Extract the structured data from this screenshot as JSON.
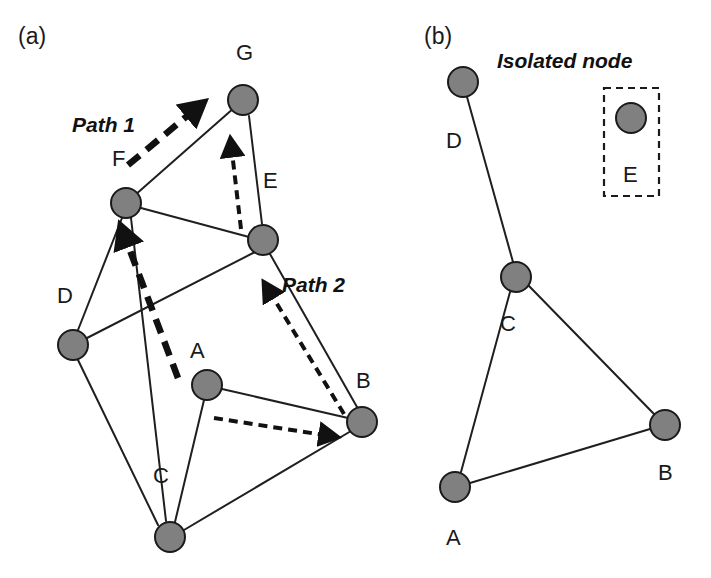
{
  "figure": {
    "width": 711,
    "height": 578,
    "background": "#ffffff",
    "node_fill": "#808080",
    "node_stroke": "#1a1a1a",
    "edge_color": "#1f1f1f",
    "arrow_color": "#111111"
  },
  "panels": [
    {
      "id": "a",
      "label": "(a)",
      "label_pos": {
        "x": 18,
        "y": 44
      },
      "nodes": [
        {
          "id": "G",
          "label": "G",
          "cx": 243,
          "cy": 100,
          "r": 15,
          "label_x": 236,
          "label_y": 60
        },
        {
          "id": "F",
          "label": "F",
          "cx": 126,
          "cy": 203,
          "r": 15,
          "label_x": 112,
          "label_y": 166
        },
        {
          "id": "E",
          "label": "E",
          "cx": 263,
          "cy": 240,
          "r": 15,
          "label_x": 263,
          "label_y": 188
        },
        {
          "id": "D",
          "label": "D",
          "cx": 73,
          "cy": 345,
          "r": 15,
          "label_x": 57,
          "label_y": 303
        },
        {
          "id": "A",
          "label": "A",
          "cx": 207,
          "cy": 385,
          "r": 15,
          "label_x": 190,
          "label_y": 358
        },
        {
          "id": "B",
          "label": "B",
          "cx": 362,
          "cy": 422,
          "r": 15,
          "label_x": 356,
          "label_y": 388
        },
        {
          "id": "C",
          "label": "C",
          "cx": 170,
          "cy": 537,
          "r": 15,
          "label_x": 153,
          "label_y": 483
        }
      ],
      "edges": [
        {
          "from": "F",
          "to": "G"
        },
        {
          "from": "G",
          "to": "E"
        },
        {
          "from": "F",
          "to": "E"
        },
        {
          "from": "F",
          "to": "D"
        },
        {
          "from": "F",
          "to": "C"
        },
        {
          "from": "D",
          "to": "A"
        },
        {
          "from": "D",
          "to": "C"
        },
        {
          "from": "E",
          "to": "B"
        },
        {
          "from": "A",
          "to": "B"
        },
        {
          "from": "A",
          "to": "C"
        },
        {
          "from": "C",
          "to": "B"
        }
      ],
      "annotations": [
        {
          "name": "path-1-label",
          "text": "Path 1",
          "x": 72,
          "y": 132
        },
        {
          "name": "path-2-label",
          "text": "Path 2",
          "x": 282,
          "y": 292
        }
      ],
      "arrows": [
        {
          "name": "arrow-path1-f-to-g",
          "style": "thick",
          "x1": 128,
          "y1": 165,
          "x2": 192,
          "y2": 112
        },
        {
          "name": "arrow-path1-a-to-f",
          "style": "thick",
          "x1": 178,
          "y1": 378,
          "x2": 126,
          "y2": 240
        },
        {
          "name": "arrow-path2-a-to-b",
          "style": "thin",
          "x1": 214,
          "y1": 418,
          "x2": 324,
          "y2": 435
        },
        {
          "name": "arrow-path2-b-to-e",
          "style": "thin",
          "x1": 344,
          "y1": 414,
          "x2": 271,
          "y2": 294
        },
        {
          "name": "arrow-path2-e-to-g",
          "style": "thin",
          "x1": 241,
          "y1": 229,
          "x2": 232,
          "y2": 152
        }
      ]
    },
    {
      "id": "b",
      "label": "(b)",
      "label_pos": {
        "x": 424,
        "y": 44
      },
      "nodes": [
        {
          "id": "D",
          "label": "D",
          "cx": 463,
          "cy": 82,
          "r": 15,
          "label_x": 446,
          "label_y": 148
        },
        {
          "id": "E",
          "label": "E",
          "cx": 631,
          "cy": 118,
          "r": 15,
          "label_x": 623,
          "label_y": 182
        },
        {
          "id": "C",
          "label": "C",
          "cx": 516,
          "cy": 277,
          "r": 15,
          "label_x": 500,
          "label_y": 331
        },
        {
          "id": "B",
          "label": "B",
          "cx": 665,
          "cy": 425,
          "r": 15,
          "label_x": 658,
          "label_y": 480
        },
        {
          "id": "A",
          "label": "A",
          "cx": 455,
          "cy": 487,
          "r": 15,
          "label_x": 446,
          "label_y": 545
        }
      ],
      "edges": [
        {
          "from": "D",
          "to": "C"
        },
        {
          "from": "C",
          "to": "B"
        },
        {
          "from": "C",
          "to": "A"
        },
        {
          "from": "A",
          "to": "B"
        }
      ],
      "annotations": [
        {
          "name": "isolated-node-label",
          "text": "Isolated node",
          "x": 497,
          "y": 68
        }
      ],
      "isolated_box": {
        "x": 604,
        "y": 88,
        "width": 55,
        "height": 108
      }
    }
  ]
}
